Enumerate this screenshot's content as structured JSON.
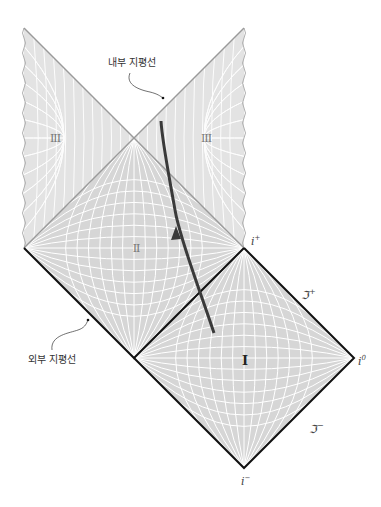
{
  "diagram": {
    "type": "penrose-diagram",
    "colors": {
      "region_fill": "#d9d9d9",
      "grid_line": "#ffffff",
      "horizon_line": "#9a9a9a",
      "boundary_line": "#111111",
      "worldline": "#3a3a3a",
      "text": "#333333"
    },
    "annotations": {
      "inner_horizon": "내부 지평선",
      "outer_horizon": "외부 지평선"
    },
    "regions": [
      {
        "id": "I",
        "label": "I"
      },
      {
        "id": "II",
        "label": "II"
      },
      {
        "id": "III-left",
        "label": "III"
      },
      {
        "id": "III-right",
        "label": "III"
      }
    ],
    "points": {
      "i_plus": {
        "base": "i",
        "sup": "+"
      },
      "i_zero": {
        "base": "i",
        "sup": "0"
      },
      "i_minus": {
        "base": "i",
        "sup": "−"
      },
      "scri_plus": {
        "base": "ℑ",
        "sup": "+"
      },
      "scri_minus": {
        "base": "ℑ",
        "sup": "−"
      }
    }
  }
}
